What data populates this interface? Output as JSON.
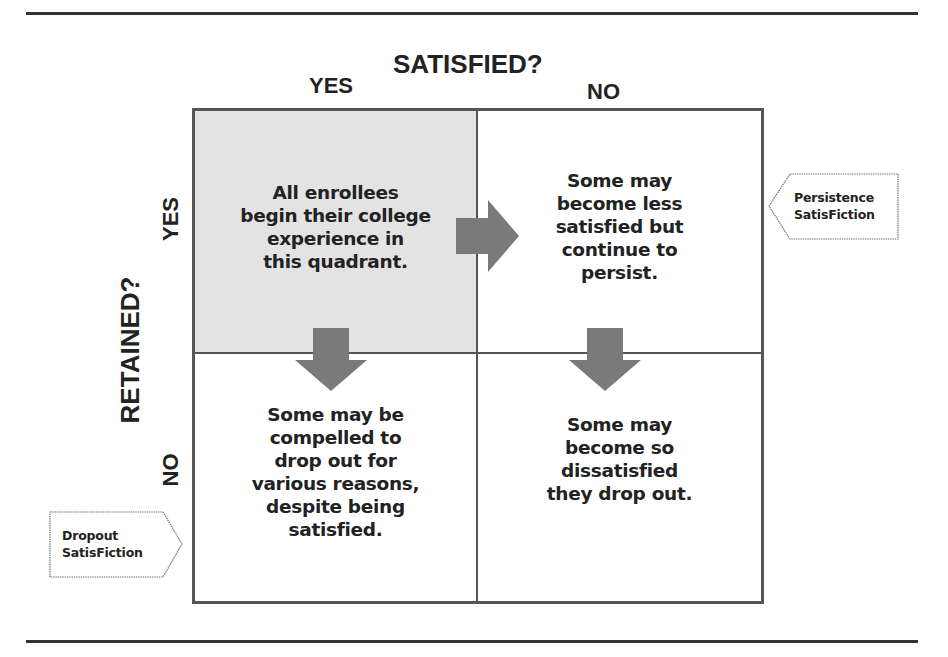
{
  "diagram": {
    "column_axis": {
      "title": "SATISFIED?",
      "labels": [
        "YES",
        "NO"
      ]
    },
    "row_axis": {
      "title": "RETAINED?",
      "labels": [
        "YES",
        "NO"
      ]
    },
    "quadrants": {
      "retained_yes_satisfied_yes": "All enrollees\nbegin their college\nexperience in\nthis quadrant.",
      "retained_yes_satisfied_no": "Some may\nbecome less\nsatisfied but\ncontinue to\npersist.",
      "retained_no_satisfied_yes": "Some may be\ncompelled to\ndrop out for\nvarious reasons,\ndespite being\nsatisfied.",
      "retained_no_satisfied_no": "Some may\nbecome so\ndissatisfied\nthey drop out."
    },
    "callouts": {
      "persistence": "Persistence\nSatisFiction",
      "dropout": "Dropout\nSatisFiction"
    },
    "arrows": [
      {
        "name": "arrow-right-top",
        "direction": "right",
        "from": "retained_yes_satisfied_yes",
        "to": "retained_yes_satisfied_no"
      },
      {
        "name": "arrow-down-left",
        "direction": "down",
        "from": "retained_yes_satisfied_yes",
        "to": "retained_no_satisfied_yes"
      },
      {
        "name": "arrow-down-right",
        "direction": "down",
        "from": "retained_yes_satisfied_no",
        "to": "retained_no_satisfied_no"
      }
    ],
    "colors": {
      "start_quadrant_fill": "#e3e3e3",
      "border": "#555555",
      "arrow": "#7a7a7a",
      "text": "#222222"
    }
  }
}
